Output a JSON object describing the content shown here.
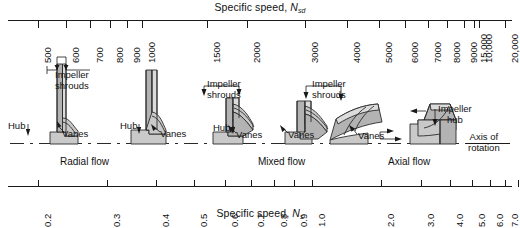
{
  "figure": {
    "top_axis": {
      "title_text": "Specific speed,",
      "title_symbol": "N",
      "title_subscript": "sd",
      "ticks": [
        {
          "label": "500",
          "x": 38
        },
        {
          "label": "600",
          "x": 66
        },
        {
          "label": "700",
          "x": 90
        },
        {
          "label": "800",
          "x": 110
        },
        {
          "label": "900",
          "x": 127
        },
        {
          "label": "1000",
          "x": 142
        },
        {
          "label": "1500",
          "x": 207
        },
        {
          "label": "2000",
          "x": 247
        },
        {
          "label": "3000",
          "x": 305
        },
        {
          "label": "4000",
          "x": 347
        },
        {
          "label": "5000",
          "x": 379
        },
        {
          "label": "6000",
          "x": 405
        },
        {
          "label": "7000",
          "x": 428
        },
        {
          "label": "8000",
          "x": 447
        },
        {
          "label": "9000",
          "x": 464
        },
        {
          "label": "10,000",
          "x": 479
        },
        {
          "label": "15,000",
          "x": 474
        },
        {
          "label": "20,000",
          "x": 505
        }
      ]
    },
    "bottom_axis": {
      "title_text": "Specific speed,",
      "title_symbol": "N",
      "title_subscript": "s",
      "ticks": [
        {
          "label": "0.2",
          "x": 38
        },
        {
          "label": "0.3",
          "x": 107
        },
        {
          "label": "0.4",
          "x": 156
        },
        {
          "label": "0.5",
          "x": 194
        },
        {
          "label": "0.6",
          "x": 225
        },
        {
          "label": "0.7",
          "x": 251
        },
        {
          "label": "0.8",
          "x": 274
        },
        {
          "label": "0.9",
          "x": 294
        },
        {
          "label": "1.0",
          "x": 312
        },
        {
          "label": "2.0",
          "x": 381
        },
        {
          "label": "3.0",
          "x": 421
        },
        {
          "label": "4.0",
          "x": 450
        },
        {
          "label": "5.0",
          "x": 472
        },
        {
          "label": "6.0",
          "x": 490
        },
        {
          "label": "7.0",
          "x": 505
        },
        {
          "label": "8.0",
          "x": 518
        }
      ]
    },
    "flow_regions": [
      {
        "label": "Radial flow",
        "x": 60,
        "y": 156
      },
      {
        "label": "Mixed flow",
        "x": 258,
        "y": 156
      },
      {
        "label": "Axial flow",
        "x": 388,
        "y": 156
      }
    ],
    "callouts": [
      {
        "name": "impeller-shrouds-1",
        "label": "Impeller\nshrouds",
        "x": 55,
        "y": 70
      },
      {
        "name": "impeller-shrouds-2",
        "label": "Impeller\nshrouds",
        "x": 207,
        "y": 79
      },
      {
        "name": "impeller-shrouds-3",
        "label": "Impeller\nshrouds",
        "x": 312,
        "y": 79
      },
      {
        "name": "impeller-hub",
        "label": "Impeller\nhub",
        "x": 438,
        "y": 104
      },
      {
        "name": "hub-1",
        "label": "Hub",
        "x": 8,
        "y": 121
      },
      {
        "name": "hub-2",
        "label": "Hub",
        "x": 120,
        "y": 121
      },
      {
        "name": "hub-3",
        "label": "Hub",
        "x": 213,
        "y": 123
      },
      {
        "name": "vanes-1",
        "label": "Vanes",
        "x": 62,
        "y": 129
      },
      {
        "name": "vanes-2",
        "label": "Vanes",
        "x": 160,
        "y": 129
      },
      {
        "name": "vanes-3",
        "label": "Vanes",
        "x": 236,
        "y": 130
      },
      {
        "name": "vanes-4",
        "label": "Vanes",
        "x": 288,
        "y": 130
      },
      {
        "name": "vanes-5",
        "label": "Vanes",
        "x": 358,
        "y": 131
      }
    ],
    "axis_of_rotation": {
      "line1": "Axis of",
      "line2": "rotation",
      "x": 468,
      "y": 132
    },
    "colors": {
      "ink": "#1a1a1a",
      "impeller_light": "#dcdcdc",
      "impeller_mid": "#c9c9c9",
      "impeller_dark": "#b3b3b3",
      "background": "#ffffff"
    }
  },
  "chart_data": {
    "type": "table",
    "xlabel_top": "Specific speed, Nsd",
    "xlabel_bottom": "Specific speed, Ns",
    "scale": "logarithmic",
    "xlim_top": [
      450,
      22000
    ],
    "xlim_bottom": [
      0.18,
      8.5
    ],
    "grid": false,
    "legend": "none",
    "top_tick_values": [
      500,
      600,
      700,
      800,
      900,
      1000,
      1500,
      2000,
      3000,
      4000,
      5000,
      6000,
      7000,
      8000,
      9000,
      10000,
      15000,
      20000
    ],
    "bottom_tick_values": [
      0.2,
      0.3,
      0.4,
      0.5,
      0.6,
      0.7,
      0.8,
      0.9,
      1.0,
      2.0,
      3.0,
      4.0,
      5.0,
      6.0,
      7.0,
      8.0
    ],
    "categories": [
      "Radial flow",
      "Mixed flow",
      "Axial flow"
    ],
    "annotations": [
      "Impeller shrouds",
      "Impeller hub",
      "Hub",
      "Vanes",
      "Axis of rotation"
    ]
  }
}
